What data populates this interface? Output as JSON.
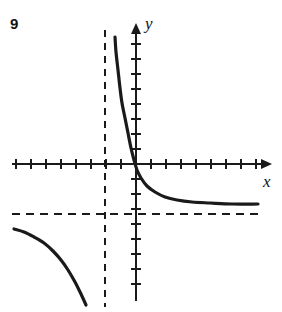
{
  "figure": {
    "problem_number": "9",
    "axis_label_x": "x",
    "axis_label_y": "y",
    "stroke_color": "#1a1a1a",
    "background_color": "#ffffff"
  },
  "chart_data": {
    "type": "line",
    "title": "",
    "subtitle": "",
    "xlabel": "x",
    "ylabel": "y",
    "grid": false,
    "legend": "none",
    "annotations": [
      "9"
    ],
    "axes": {
      "x_axis_pixel_y": 164,
      "y_axis_pixel_x": 136,
      "x_axis_start_px": 12,
      "x_axis_end_px": 272,
      "y_axis_top_px": 23,
      "y_axis_bottom_px": 301,
      "tick_spacing_px": 15,
      "tick_half_length_px": 5,
      "x_ticks_left_count": 8,
      "x_ticks_right_count": 8,
      "y_ticks_up_count": 8,
      "y_ticks_down_count": 8,
      "arrow_x": true,
      "arrow_y": true,
      "xlim": [
        -8,
        9
      ],
      "ylim": [
        -9,
        9
      ]
    },
    "asymptotes": [
      {
        "name": "vertical-asymptote",
        "orientation": "vertical",
        "x_value": -2,
        "pixel_x": 105,
        "pixel_y_start": 30,
        "pixel_y_end": 307,
        "style": "dashed"
      },
      {
        "name": "horizontal-asymptote",
        "orientation": "horizontal",
        "y_value": -3.3,
        "pixel_y": 214,
        "pixel_x_start": 12,
        "pixel_x_end": 262,
        "style": "dashed"
      }
    ],
    "series": [
      {
        "name": "branch-upper-right",
        "description": "Branch right of the vertical asymptote, descending from upper left toward the horizontal asymptote",
        "points_px": [
          [
            115,
            37
          ],
          [
            116,
            52
          ],
          [
            118,
            70
          ],
          [
            120,
            88
          ],
          [
            122,
            103
          ],
          [
            125,
            118
          ],
          [
            128,
            133
          ],
          [
            131,
            148
          ],
          [
            134,
            160
          ],
          [
            137,
            170
          ],
          [
            141,
            178
          ],
          [
            147,
            186
          ],
          [
            155,
            192
          ],
          [
            165,
            197
          ],
          [
            177,
            200
          ],
          [
            192,
            202
          ],
          [
            210,
            203
          ],
          [
            232,
            204
          ],
          [
            258,
            204
          ]
        ]
      },
      {
        "name": "branch-lower-left",
        "description": "Branch left of the vertical asymptote, descending from the horizontal asymptote toward negative infinity",
        "points_px": [
          [
            14,
            229
          ],
          [
            24,
            232
          ],
          [
            34,
            237
          ],
          [
            44,
            243
          ],
          [
            53,
            251
          ],
          [
            61,
            260
          ],
          [
            68,
            270
          ],
          [
            75,
            282
          ],
          [
            81,
            294
          ],
          [
            86,
            305
          ]
        ]
      }
    ]
  }
}
